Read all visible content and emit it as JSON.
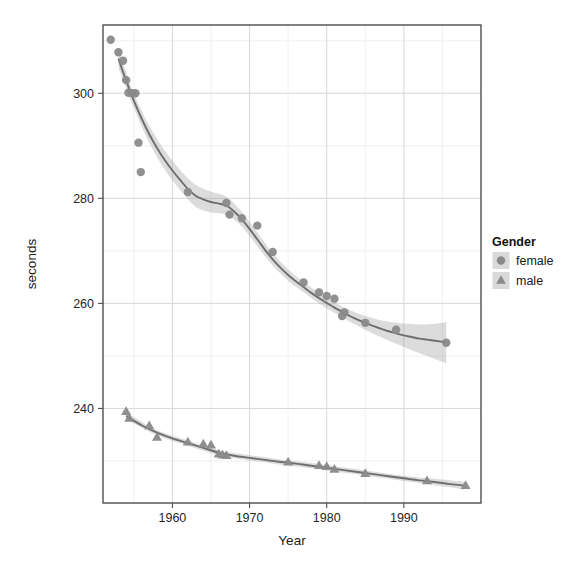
{
  "chart_data": {
    "type": "scatter",
    "title": "",
    "subtitle": "",
    "xlabel": "Year",
    "ylabel": "seconds",
    "xlim": [
      1951,
      2000
    ],
    "ylim": [
      222,
      313
    ],
    "x_ticks": [
      1960,
      1970,
      1980,
      1990
    ],
    "x_tick_labels": [
      "1960",
      "1970",
      "1980",
      "1990"
    ],
    "y_ticks": [
      240,
      260,
      280,
      300
    ],
    "y_tick_labels": [
      "240",
      "260",
      "280",
      "300"
    ],
    "x_minor_ticks": [
      1955,
      1965,
      1975,
      1985,
      1995
    ],
    "y_minor_ticks": [
      230,
      250,
      270,
      290,
      310
    ],
    "grid": true,
    "legend": {
      "title": "Gender",
      "position": "right",
      "entries": [
        {
          "label": "female",
          "marker": "circle",
          "color": "#8a8a8a"
        },
        {
          "label": "male",
          "marker": "triangle",
          "color": "#8a8a8a"
        }
      ]
    },
    "colors": {
      "point": "#8a8a8a",
      "line": "#6e6e6e",
      "ribbon": "#9a9a9a",
      "grid_major": "#d3d3d8",
      "grid_minor": "#e9e9ee",
      "panel_border": "#4d4d4d",
      "background": "#ffffff"
    },
    "series": [
      {
        "name": "female",
        "marker": "circle",
        "points": [
          {
            "x": 1952,
            "y": 310.2
          },
          {
            "x": 1953,
            "y": 307.8
          },
          {
            "x": 1953.6,
            "y": 306.2
          },
          {
            "x": 1954,
            "y": 302.5
          },
          {
            "x": 1954.3,
            "y": 300.1
          },
          {
            "x": 1954.8,
            "y": 300.0
          },
          {
            "x": 1955.2,
            "y": 300.0
          },
          {
            "x": 1955.6,
            "y": 290.6
          },
          {
            "x": 1955.9,
            "y": 285.0
          },
          {
            "x": 1962.0,
            "y": 281.2
          },
          {
            "x": 1967.0,
            "y": 279.1
          },
          {
            "x": 1967.4,
            "y": 276.9
          },
          {
            "x": 1969.0,
            "y": 276.2
          },
          {
            "x": 1971.0,
            "y": 274.8
          },
          {
            "x": 1973.0,
            "y": 269.8
          },
          {
            "x": 1977.0,
            "y": 264.0
          },
          {
            "x": 1979.0,
            "y": 262.1
          },
          {
            "x": 1980.0,
            "y": 261.4
          },
          {
            "x": 1981.0,
            "y": 260.9
          },
          {
            "x": 1982.0,
            "y": 257.6
          },
          {
            "x": 1982.3,
            "y": 258.3
          },
          {
            "x": 1985.0,
            "y": 256.3
          },
          {
            "x": 1989.0,
            "y": 255.0
          },
          {
            "x": 1995.5,
            "y": 252.5
          }
        ],
        "trend": [
          {
            "x": 1953.0,
            "y": 306.6
          },
          {
            "x": 1954.0,
            "y": 302.4
          },
          {
            "x": 1955.0,
            "y": 298.6
          },
          {
            "x": 1956.0,
            "y": 295.2
          },
          {
            "x": 1957.0,
            "y": 292.2
          },
          {
            "x": 1958.0,
            "y": 289.6
          },
          {
            "x": 1959.0,
            "y": 287.3
          },
          {
            "x": 1960.0,
            "y": 285.3
          },
          {
            "x": 1961.0,
            "y": 283.5
          },
          {
            "x": 1962.0,
            "y": 281.8
          },
          {
            "x": 1963.0,
            "y": 280.5
          },
          {
            "x": 1964.0,
            "y": 279.8
          },
          {
            "x": 1965.0,
            "y": 279.3
          },
          {
            "x": 1966.0,
            "y": 279.0
          },
          {
            "x": 1967.0,
            "y": 278.6
          },
          {
            "x": 1968.0,
            "y": 277.5
          },
          {
            "x": 1969.0,
            "y": 276.0
          },
          {
            "x": 1970.0,
            "y": 274.2
          },
          {
            "x": 1971.0,
            "y": 272.2
          },
          {
            "x": 1972.0,
            "y": 270.2
          },
          {
            "x": 1973.0,
            "y": 268.4
          },
          {
            "x": 1974.0,
            "y": 266.8
          },
          {
            "x": 1975.0,
            "y": 265.4
          },
          {
            "x": 1976.0,
            "y": 264.2
          },
          {
            "x": 1977.0,
            "y": 263.1
          },
          {
            "x": 1978.0,
            "y": 262.0
          },
          {
            "x": 1979.0,
            "y": 261.0
          },
          {
            "x": 1980.0,
            "y": 260.1
          },
          {
            "x": 1981.0,
            "y": 259.2
          },
          {
            "x": 1982.0,
            "y": 258.4
          },
          {
            "x": 1983.0,
            "y": 257.6
          },
          {
            "x": 1984.0,
            "y": 256.9
          },
          {
            "x": 1985.0,
            "y": 256.3
          },
          {
            "x": 1986.0,
            "y": 255.7
          },
          {
            "x": 1987.0,
            "y": 255.2
          },
          {
            "x": 1988.0,
            "y": 254.7
          },
          {
            "x": 1989.0,
            "y": 254.3
          },
          {
            "x": 1990.0,
            "y": 253.9
          },
          {
            "x": 1991.0,
            "y": 253.6
          },
          {
            "x": 1992.0,
            "y": 253.3
          },
          {
            "x": 1993.0,
            "y": 253.1
          },
          {
            "x": 1994.0,
            "y": 252.9
          },
          {
            "x": 1995.5,
            "y": 252.6
          }
        ],
        "band": [
          {
            "x": 1953.0,
            "lo": 304.8,
            "hi": 308.4
          },
          {
            "x": 1955.0,
            "lo": 297.2,
            "hi": 300.0
          },
          {
            "x": 1957.0,
            "lo": 290.6,
            "hi": 293.8
          },
          {
            "x": 1959.0,
            "lo": 285.5,
            "hi": 289.1
          },
          {
            "x": 1961.0,
            "lo": 281.6,
            "hi": 285.4
          },
          {
            "x": 1963.0,
            "lo": 278.4,
            "hi": 282.6
          },
          {
            "x": 1965.0,
            "lo": 277.3,
            "hi": 281.3
          },
          {
            "x": 1967.0,
            "lo": 276.9,
            "hi": 280.3
          },
          {
            "x": 1969.0,
            "lo": 274.6,
            "hi": 277.4
          },
          {
            "x": 1971.0,
            "lo": 270.9,
            "hi": 273.5
          },
          {
            "x": 1973.0,
            "lo": 267.2,
            "hi": 269.6
          },
          {
            "x": 1975.0,
            "lo": 264.3,
            "hi": 266.5
          },
          {
            "x": 1977.0,
            "lo": 262.1,
            "hi": 264.1
          },
          {
            "x": 1979.0,
            "lo": 260.0,
            "hi": 262.0
          },
          {
            "x": 1981.0,
            "lo": 258.2,
            "hi": 260.2
          },
          {
            "x": 1983.0,
            "lo": 256.5,
            "hi": 258.7
          },
          {
            "x": 1985.0,
            "lo": 255.0,
            "hi": 257.6
          },
          {
            "x": 1987.0,
            "lo": 253.6,
            "hi": 256.8
          },
          {
            "x": 1989.0,
            "lo": 252.3,
            "hi": 256.3
          },
          {
            "x": 1991.0,
            "lo": 251.1,
            "hi": 256.1
          },
          {
            "x": 1993.0,
            "lo": 250.0,
            "hi": 256.0
          },
          {
            "x": 1995.5,
            "lo": 248.6,
            "hi": 256.4
          }
        ]
      },
      {
        "name": "male",
        "marker": "triangle",
        "points": [
          {
            "x": 1954.0,
            "y": 239.4
          },
          {
            "x": 1954.4,
            "y": 238.1
          },
          {
            "x": 1957.0,
            "y": 236.7
          },
          {
            "x": 1958.0,
            "y": 234.5
          },
          {
            "x": 1962.0,
            "y": 233.6
          },
          {
            "x": 1964.0,
            "y": 233.2
          },
          {
            "x": 1965.0,
            "y": 233.0
          },
          {
            "x": 1966.0,
            "y": 231.3
          },
          {
            "x": 1966.5,
            "y": 231.1
          },
          {
            "x": 1967.0,
            "y": 231.0
          },
          {
            "x": 1975.0,
            "y": 229.8
          },
          {
            "x": 1979.0,
            "y": 229.1
          },
          {
            "x": 1980.0,
            "y": 228.9
          },
          {
            "x": 1981.0,
            "y": 228.4
          },
          {
            "x": 1985.0,
            "y": 227.6
          },
          {
            "x": 1993.0,
            "y": 226.2
          },
          {
            "x": 1998.0,
            "y": 225.3
          }
        ],
        "trend": [
          {
            "x": 1954.0,
            "y": 238.6
          },
          {
            "x": 1956.0,
            "y": 236.8
          },
          {
            "x": 1958.0,
            "y": 235.4
          },
          {
            "x": 1960.0,
            "y": 234.3
          },
          {
            "x": 1962.0,
            "y": 233.4
          },
          {
            "x": 1964.0,
            "y": 232.5
          },
          {
            "x": 1966.0,
            "y": 231.6
          },
          {
            "x": 1968.0,
            "y": 231.0
          },
          {
            "x": 1970.0,
            "y": 230.6
          },
          {
            "x": 1972.0,
            "y": 230.2
          },
          {
            "x": 1974.0,
            "y": 229.8
          },
          {
            "x": 1976.0,
            "y": 229.5
          },
          {
            "x": 1978.0,
            "y": 229.1
          },
          {
            "x": 1980.0,
            "y": 228.7
          },
          {
            "x": 1982.0,
            "y": 228.3
          },
          {
            "x": 1984.0,
            "y": 227.9
          },
          {
            "x": 1986.0,
            "y": 227.5
          },
          {
            "x": 1988.0,
            "y": 227.1
          },
          {
            "x": 1990.0,
            "y": 226.7
          },
          {
            "x": 1992.0,
            "y": 226.3
          },
          {
            "x": 1994.0,
            "y": 226.0
          },
          {
            "x": 1996.0,
            "y": 225.6
          },
          {
            "x": 1998.0,
            "y": 225.3
          }
        ],
        "band": [
          {
            "x": 1954.0,
            "lo": 237.9,
            "hi": 239.3
          },
          {
            "x": 1958.0,
            "lo": 234.9,
            "hi": 235.9
          },
          {
            "x": 1962.0,
            "lo": 232.9,
            "hi": 233.9
          },
          {
            "x": 1966.0,
            "lo": 231.1,
            "hi": 232.1
          },
          {
            "x": 1970.0,
            "lo": 230.1,
            "hi": 231.1
          },
          {
            "x": 1974.0,
            "lo": 229.3,
            "hi": 230.3
          },
          {
            "x": 1978.0,
            "lo": 228.6,
            "hi": 229.6
          },
          {
            "x": 1982.0,
            "lo": 227.8,
            "hi": 228.8
          },
          {
            "x": 1986.0,
            "lo": 227.0,
            "hi": 228.0
          },
          {
            "x": 1990.0,
            "lo": 226.2,
            "hi": 227.2
          },
          {
            "x": 1994.0,
            "lo": 225.4,
            "hi": 226.6
          },
          {
            "x": 1998.0,
            "lo": 224.6,
            "hi": 226.0
          }
        ]
      }
    ]
  }
}
